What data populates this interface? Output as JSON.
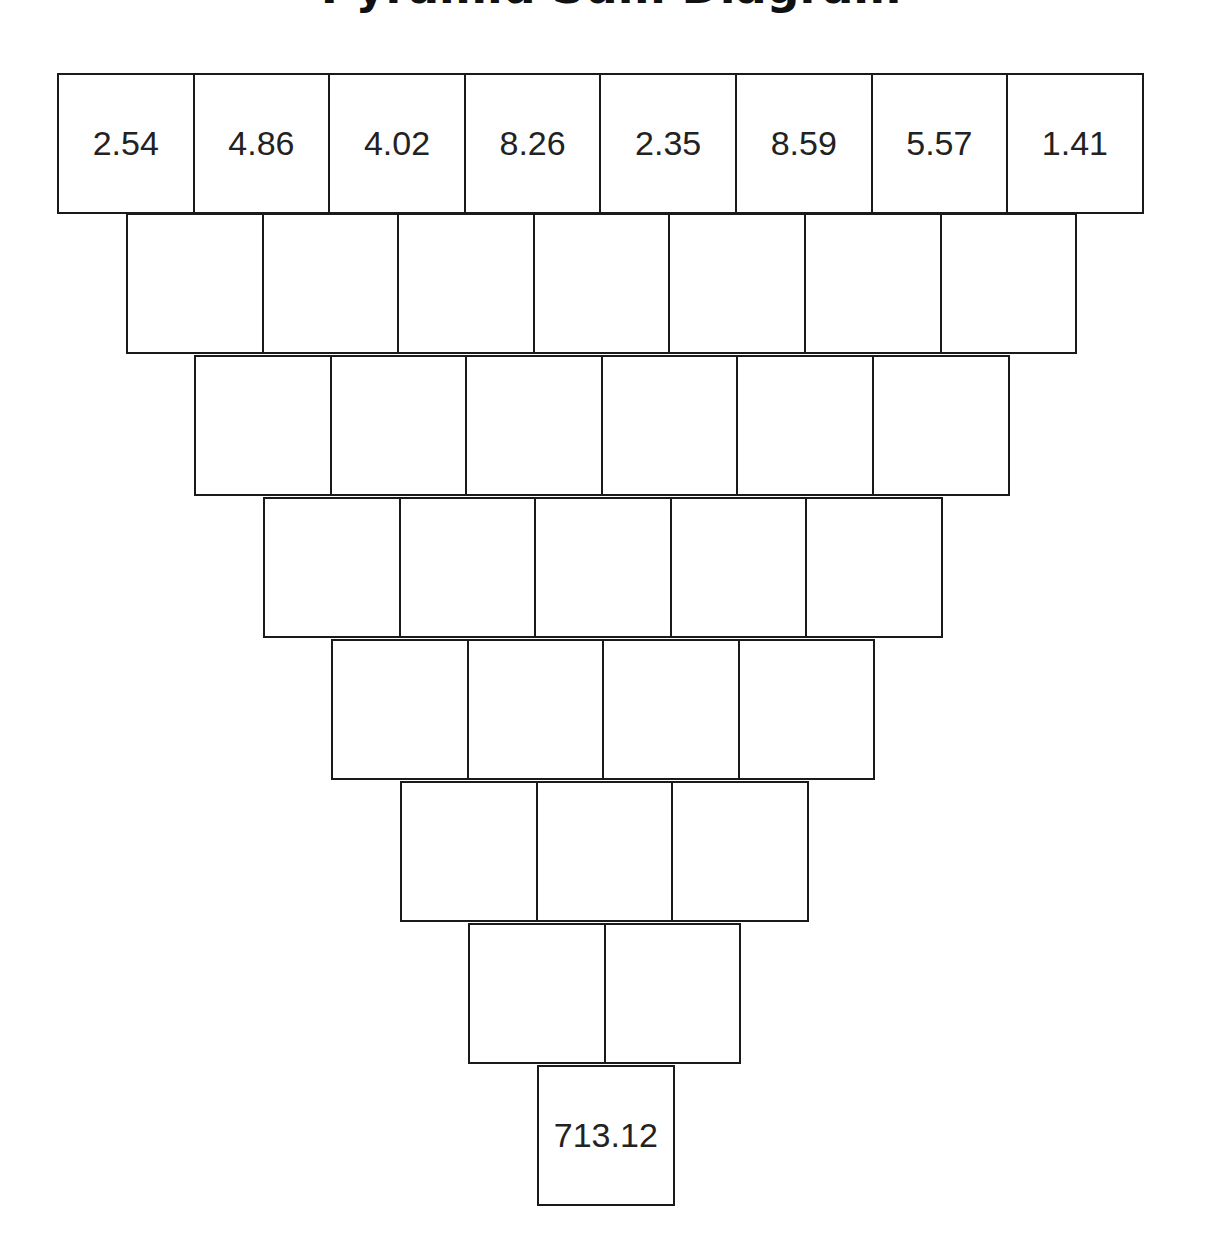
{
  "title": "Pyramid Sum Diagram",
  "diagram": {
    "type": "inverted-number-pyramid",
    "rows": [
      [
        "2.54",
        "4.86",
        "4.02",
        "8.26",
        "2.35",
        "8.59",
        "5.57",
        "1.41"
      ],
      [
        "",
        "",
        "",
        "",
        "",
        "",
        ""
      ],
      [
        "",
        "",
        "",
        "",
        "",
        ""
      ],
      [
        "",
        "",
        "",
        "",
        ""
      ],
      [
        "",
        "",
        "",
        ""
      ],
      [
        "",
        "",
        ""
      ],
      [
        "",
        ""
      ],
      [
        "713.12"
      ]
    ]
  },
  "colors": {
    "border": "#1a1a1a",
    "text": "#222222",
    "background": "#ffffff"
  }
}
